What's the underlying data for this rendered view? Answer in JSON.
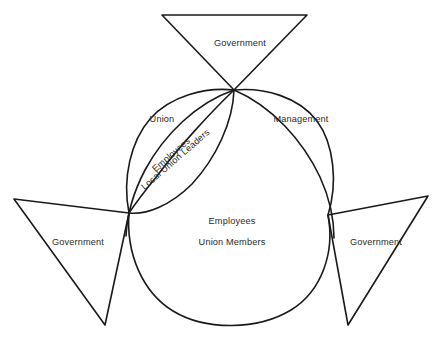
{
  "figure": {
    "caption_top": "",
    "background_color": "#ffffff",
    "stroke_color": "#1a1a1a",
    "text_color": "#2b2b2b"
  },
  "shapes": {
    "triangle_top": {
      "label": "Government"
    },
    "triangle_left": {
      "label": "Government"
    },
    "triangle_right": {
      "label": "Government"
    },
    "lobe_left": {
      "label": "Union"
    },
    "lobe_right": {
      "label": "Management"
    },
    "lens_center": {
      "label_line1": "Employees",
      "label_line2": "Local Union Leaders"
    },
    "oval_bottom": {
      "label_line1": "Employees",
      "label_line2": "Union Members"
    }
  }
}
